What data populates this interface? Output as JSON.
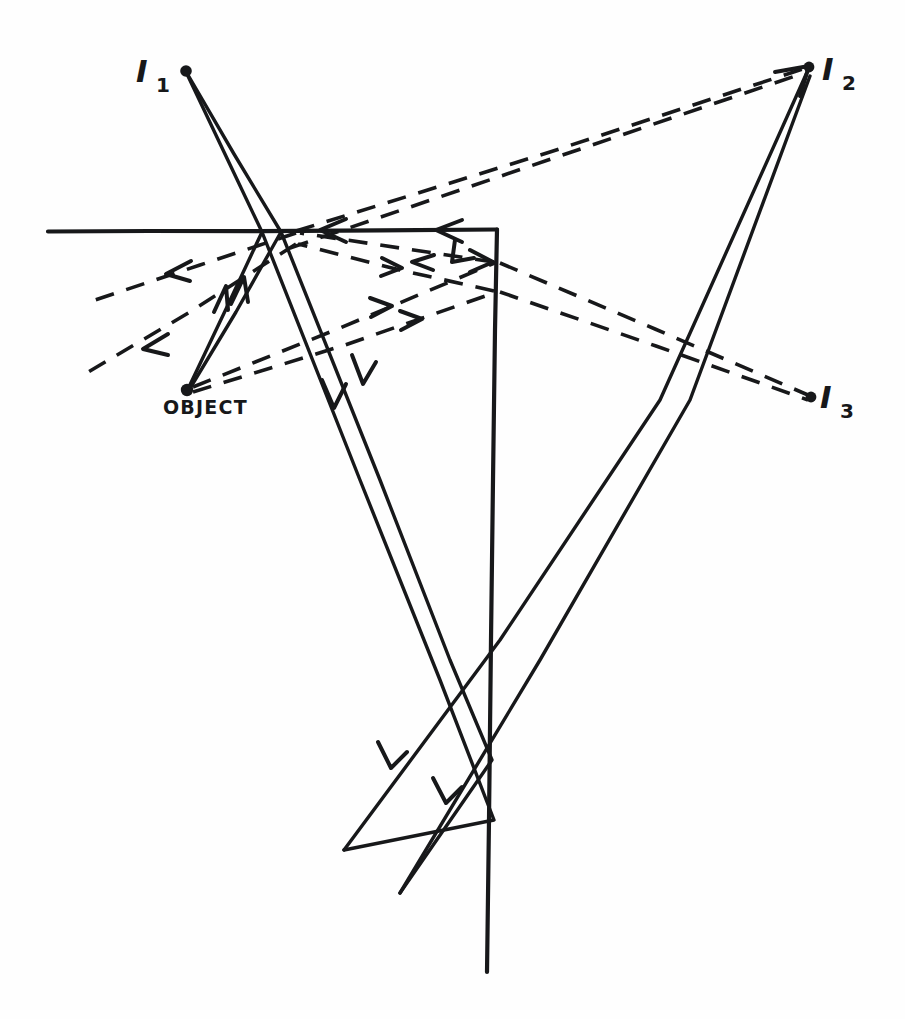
{
  "figure": {
    "kind": "hand-drawn-ray-diagram",
    "title": "",
    "background_color": "#fefefe",
    "ink_color": "#17181a",
    "width": 905,
    "height": 1019
  },
  "labels": {
    "image1": {
      "text": "I",
      "subscript": "1",
      "x": 136,
      "y": 82
    },
    "image2": {
      "text": "I",
      "subscript": "2",
      "x": 822,
      "y": 80
    },
    "image3": {
      "text": "I",
      "subscript": "3",
      "x": 820,
      "y": 408
    },
    "object": {
      "text": "OBJECT",
      "x": 163,
      "y": 414
    }
  },
  "points": {
    "object": {
      "x": 187,
      "y": 390,
      "label": "OBJECT"
    },
    "image1": {
      "x": 186,
      "y": 72,
      "label": "I1"
    },
    "image2": {
      "x": 810,
      "y": 66,
      "label": "I2"
    },
    "image3": {
      "x": 812,
      "y": 398,
      "label": "I3"
    }
  },
  "mirrors": [
    {
      "name": "horizontal-mirror",
      "x1": 48,
      "y1": 231,
      "x2": 497,
      "y2": 229
    },
    {
      "name": "vertical-mirror",
      "x1": 497,
      "y1": 229,
      "x2": 487,
      "y2": 972
    }
  ],
  "solid_rays": [
    {
      "name": "object-ray-a-incident",
      "x1": 187,
      "y1": 390,
      "x2": 262,
      "y2": 231
    },
    {
      "name": "object-ray-b-incident",
      "x1": 187,
      "y1": 390,
      "x2": 281,
      "y2": 231
    },
    {
      "name": "object-ray-a-reflected",
      "x1": 262,
      "y1": 231,
      "x2": 344,
      "y2": 850
    },
    {
      "name": "object-ray-b-reflected",
      "x1": 281,
      "y1": 231,
      "x2": 400,
      "y2": 893
    },
    {
      "name": "virtual-ray-i1-a",
      "x1": 186,
      "y1": 72,
      "x2": 262,
      "y2": 231
    },
    {
      "name": "virtual-ray-i1-b",
      "x1": 186,
      "y1": 72,
      "x2": 281,
      "y2": 231
    },
    {
      "name": "virtual-ray-i2-a",
      "x1": 810,
      "y1": 66,
      "x2": 344,
      "y2": 850
    },
    {
      "name": "virtual-ray-i2-b",
      "x1": 810,
      "y1": 66,
      "x2": 400,
      "y2": 893
    }
  ],
  "dashed_rays": [
    {
      "name": "object-to-vertical-mirror-upper",
      "x1": 190,
      "y1": 388,
      "x2": 497,
      "y2": 262
    },
    {
      "name": "object-to-vertical-mirror-lower",
      "x1": 190,
      "y1": 392,
      "x2": 497,
      "y2": 291
    },
    {
      "name": "vertical-reflect-to-horizontal-upper",
      "x1": 497,
      "y1": 262,
      "x2": 292,
      "y2": 231
    },
    {
      "name": "vertical-reflect-to-horizontal-lower",
      "x1": 497,
      "y1": 291,
      "x2": 292,
      "y2": 231
    },
    {
      "name": "horizontal-exit-left-upper",
      "x1": 292,
      "y1": 231,
      "x2": 95,
      "y2": 300
    },
    {
      "name": "horizontal-exit-left-lower",
      "x1": 292,
      "y1": 231,
      "x2": 78,
      "y2": 378
    },
    {
      "name": "i2-virtual-upper",
      "x1": 810,
      "y1": 66,
      "x2": 292,
      "y2": 231
    },
    {
      "name": "i2-virtual-lower",
      "x1": 810,
      "y1": 66,
      "x2": 292,
      "y2": 247
    },
    {
      "name": "i3-virtual-upper",
      "x1": 497,
      "y1": 262,
      "x2": 812,
      "y2": 396
    },
    {
      "name": "i3-virtual-lower",
      "x1": 497,
      "y1": 291,
      "x2": 812,
      "y2": 400
    }
  ],
  "arrow_marks": [
    {
      "name": "arrow-up-object-ray-a",
      "x": 224,
      "y": 288,
      "dir": "up-right"
    },
    {
      "name": "arrow-up-object-ray-b",
      "x": 243,
      "y": 278,
      "dir": "up-right"
    },
    {
      "name": "arrow-down-reflected-a",
      "x": 334,
      "y": 405,
      "dir": "down-right"
    },
    {
      "name": "arrow-down-reflected-b",
      "x": 360,
      "y": 380,
      "dir": "down-right"
    },
    {
      "name": "arrow-down-lower-a",
      "x": 392,
      "y": 760,
      "dir": "down-left"
    },
    {
      "name": "arrow-down-lower-b",
      "x": 447,
      "y": 795,
      "dir": "down-left"
    },
    {
      "name": "arrow-left-mirror-mid",
      "x": 328,
      "y": 231,
      "dir": "left"
    },
    {
      "name": "arrow-left-mirror-right",
      "x": 443,
      "y": 231,
      "dir": "left"
    },
    {
      "name": "arrow-upleft-corner",
      "x": 462,
      "y": 247,
      "dir": "up-left"
    },
    {
      "name": "arrow-left-dash-upper",
      "x": 175,
      "y": 272,
      "dir": "down-left"
    },
    {
      "name": "arrow-left-dash-lower",
      "x": 152,
      "y": 346,
      "dir": "down-left"
    },
    {
      "name": "arrow-right-dash-upper",
      "x": 387,
      "y": 308,
      "dir": "right"
    },
    {
      "name": "arrow-right-dash-lower",
      "x": 418,
      "y": 321,
      "dir": "right"
    },
    {
      "name": "arrow-right-at-mirror",
      "x": 489,
      "y": 262,
      "dir": "right"
    },
    {
      "name": "arrow-cross-dash",
      "x": 398,
      "y": 267,
      "dir": "right"
    }
  ]
}
